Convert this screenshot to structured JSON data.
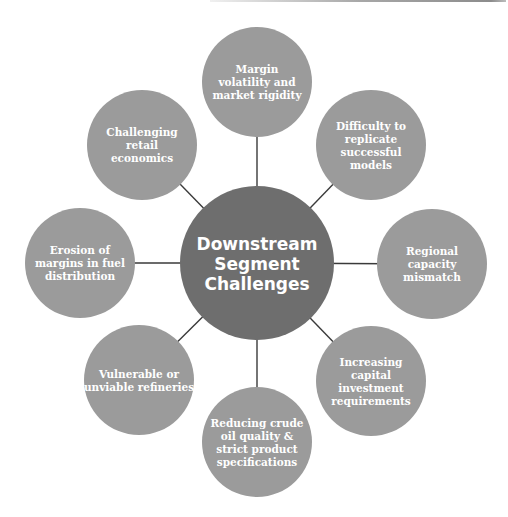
{
  "diagram": {
    "center": {
      "lines": [
        "Downstream",
        "Segment",
        "Challenges"
      ]
    },
    "nodes": [
      {
        "id": "margin-volatility",
        "lines": [
          "Margin",
          "volatility and",
          "market rigidity"
        ]
      },
      {
        "id": "difficulty-replicate",
        "lines": [
          "Difficulty to",
          "replicate",
          "successful",
          "models"
        ]
      },
      {
        "id": "regional-capacity",
        "lines": [
          "Regional",
          "capacity",
          "mismatch"
        ]
      },
      {
        "id": "capital-investment",
        "lines": [
          "Increasing",
          "capital",
          "investment",
          "requirements"
        ]
      },
      {
        "id": "crude-oil-quality",
        "lines": [
          "Reducing crude",
          "oil quality &",
          "strict product",
          "specifications"
        ]
      },
      {
        "id": "vulnerable-refineries",
        "lines": [
          "Vulnerable or",
          "unviable refineries"
        ]
      },
      {
        "id": "erosion-margins",
        "lines": [
          "Erosion of",
          "margins in fuel",
          "distribution"
        ]
      },
      {
        "id": "retail-economics",
        "lines": [
          "Challenging",
          "retail",
          "economics"
        ]
      }
    ],
    "colors": {
      "center": "#6e6e6e",
      "outer": "#9b9b9b",
      "connector": "#3a3a3a",
      "text": "#ffffff"
    }
  }
}
